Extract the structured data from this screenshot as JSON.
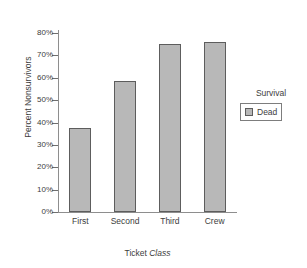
{
  "chart_data": {
    "type": "bar",
    "title": "",
    "subtitle": "",
    "categories": [
      "First",
      "Second",
      "Third",
      "Crew"
    ],
    "values": [
      37.5,
      58.5,
      75.0,
      76.0
    ],
    "series": [
      {
        "name": "Dead",
        "values": [
          37.5,
          58.5,
          75.0,
          76.0
        ]
      }
    ],
    "xlabel_prefix": "Ticket ",
    "xlabel_emphasis": "Class",
    "xlabel": "Ticket Class",
    "ylabel": "Percent Nonsurvivors",
    "ylim": [
      0,
      80
    ],
    "ytick_labels": [
      "0%",
      "10%",
      "20%",
      "30%",
      "40%",
      "50%",
      "60%",
      "70%",
      "80%"
    ],
    "ytick_values": [
      0,
      10,
      20,
      30,
      40,
      50,
      60,
      70,
      80
    ],
    "grid": false,
    "legend_position": "right",
    "legend_title": "Survival",
    "legend_entries": [
      {
        "label": "Dead",
        "color": "#b8b8b8"
      }
    ],
    "colors": {
      "bar_fill": "#b8b8b8",
      "bar_border": "#5d5d5d",
      "axis": "#8e8e8e",
      "text": "#3d3d3d",
      "background": "#ffffff"
    }
  }
}
